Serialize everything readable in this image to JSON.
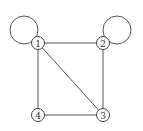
{
  "diagram": {
    "type": "undirected-graph",
    "nodes": [
      {
        "id": "1",
        "label": "1",
        "x": 38,
        "y": 43
      },
      {
        "id": "2",
        "label": "2",
        "x": 103,
        "y": 43
      },
      {
        "id": "3",
        "label": "3",
        "x": 103,
        "y": 115
      },
      {
        "id": "4",
        "label": "4",
        "x": 38,
        "y": 115
      }
    ],
    "edges": [
      {
        "from": "1",
        "to": "2"
      },
      {
        "from": "2",
        "to": "3"
      },
      {
        "from": "3",
        "to": "4"
      },
      {
        "from": "4",
        "to": "1"
      },
      {
        "from": "1",
        "to": "3"
      }
    ],
    "loops": [
      {
        "node": "1",
        "cx": 24,
        "cy": 30,
        "r": 14
      },
      {
        "node": "2",
        "cx": 117,
        "cy": 30,
        "r": 14
      }
    ],
    "colors": {
      "stroke": "#555555",
      "background": "#ffffff"
    }
  }
}
